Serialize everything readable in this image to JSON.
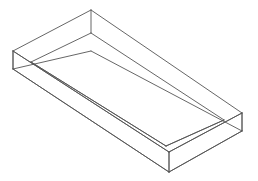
{
  "figure": {
    "kind": "wireframe-line-drawing",
    "background_color": "#ffffff",
    "line_color": "#555555",
    "line_width": 0.9,
    "canvas": {
      "width": 258,
      "height": 181
    },
    "projection": "parallel (isometric-like), viewed from above-front",
    "wall_thickness_px": 18,
    "vertices": {
      "outer_top_back": [
        91,
        10
      ],
      "outer_top_left": [
        13,
        51
      ],
      "outer_top_right": [
        242,
        113
      ],
      "outer_top_front": [
        169,
        152
      ],
      "inner_top_back": [
        91,
        33
      ],
      "inner_top_left": [
        31,
        62
      ],
      "inner_top_right": [
        224,
        120
      ],
      "inner_top_front": [
        166,
        146
      ],
      "outer_bottom_left": [
        13,
        69
      ],
      "outer_bottom_right": [
        242,
        131
      ],
      "outer_bottom_front": [
        169,
        172
      ],
      "inner_bottom_back": [
        91,
        51
      ]
    },
    "edges": [
      {
        "name": "outer-rim-back-left",
        "from": "outer_top_back",
        "to": "outer_top_left"
      },
      {
        "name": "outer-rim-back-right",
        "from": "outer_top_back",
        "to": "outer_top_right"
      },
      {
        "name": "outer-rim-front-left",
        "from": "outer_top_left",
        "to": "outer_top_front"
      },
      {
        "name": "outer-rim-front-right",
        "from": "outer_top_front",
        "to": "outer_top_right"
      },
      {
        "name": "inner-rim-back-left",
        "from": "inner_top_back",
        "to": "inner_top_left"
      },
      {
        "name": "inner-rim-back-right",
        "from": "inner_top_back",
        "to": "inner_top_right"
      },
      {
        "name": "inner-rim-front-left",
        "from": "inner_top_left",
        "to": "inner_top_front"
      },
      {
        "name": "inner-rim-front-right",
        "from": "inner_top_front",
        "to": "inner_top_right"
      },
      {
        "name": "wall-vertical-back",
        "from": "outer_top_back",
        "to": "inner_top_back"
      },
      {
        "name": "wall-vertical-left",
        "from": "outer_top_left",
        "to": "outer_bottom_left"
      },
      {
        "name": "wall-vertical-right",
        "from": "outer_top_right",
        "to": "outer_bottom_right"
      },
      {
        "name": "wall-vertical-front",
        "from": "outer_top_front",
        "to": "outer_bottom_front"
      },
      {
        "name": "base-edge-left",
        "from": "outer_bottom_left",
        "to": "outer_bottom_front"
      },
      {
        "name": "base-edge-right",
        "from": "outer_bottom_front",
        "to": "outer_bottom_right"
      },
      {
        "name": "hidden-base-back-left",
        "from": "outer_bottom_left",
        "to": "inner_bottom_back"
      },
      {
        "name": "hidden-base-back-right",
        "from": "inner_bottom_back",
        "to": "outer_bottom_right"
      }
    ],
    "labels": [],
    "annotations": []
  }
}
